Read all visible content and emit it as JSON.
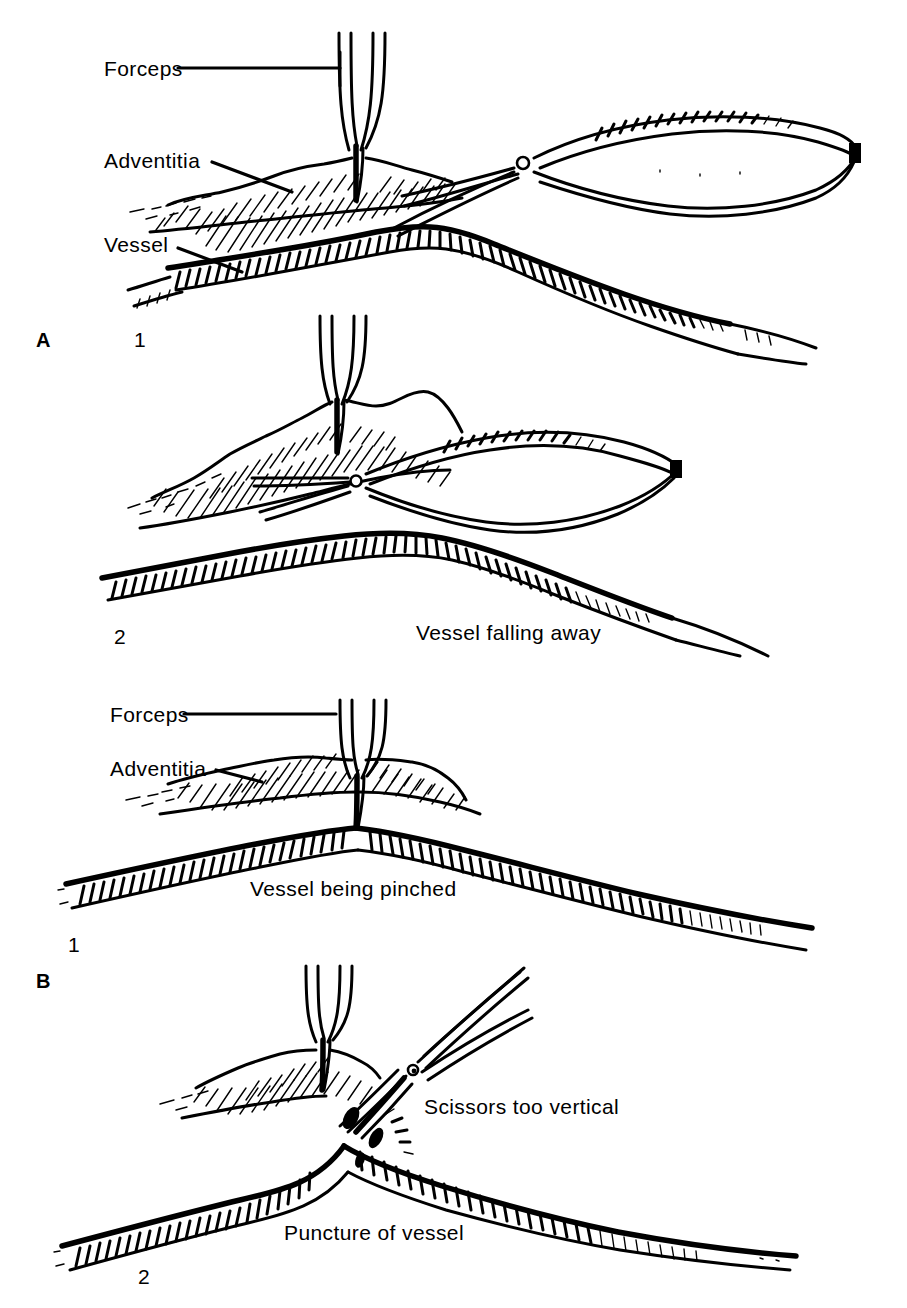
{
  "figure": {
    "kind": "surgical-technique-line-drawing",
    "background_color": "#ffffff",
    "ink_color": "#000000"
  },
  "panels": [
    {
      "id": "A1",
      "letter": "A",
      "number": "1",
      "labels": [
        {
          "name": "forceps",
          "text": "Forceps"
        },
        {
          "name": "adventitia",
          "text": "Adventitia"
        },
        {
          "name": "vessel",
          "text": "Vessel"
        }
      ],
      "captions": [],
      "instruments": [
        "forceps",
        "spring-scissors"
      ],
      "tissue": [
        "adventitia",
        "vessel-wall"
      ]
    },
    {
      "id": "A2",
      "letter": "",
      "number": "2",
      "labels": [],
      "captions": [
        {
          "name": "vessel-falling-away",
          "text": "Vessel falling away"
        }
      ],
      "instruments": [
        "forceps",
        "spring-scissors"
      ],
      "tissue": [
        "adventitia",
        "vessel-wall"
      ]
    },
    {
      "id": "B1",
      "letter": "",
      "number": "1",
      "labels": [
        {
          "name": "forceps",
          "text": "Forceps"
        },
        {
          "name": "adventitia",
          "text": "Adventitia"
        }
      ],
      "captions": [
        {
          "name": "vessel-being-pinched",
          "text": "Vessel being pinched"
        }
      ],
      "instruments": [
        "forceps"
      ],
      "tissue": [
        "adventitia",
        "vessel-wall"
      ]
    },
    {
      "id": "B2",
      "letter": "B",
      "number": "2",
      "labels": [],
      "captions": [
        {
          "name": "scissors-too-vertical",
          "text": "Scissors too vertical"
        },
        {
          "name": "puncture-of-vessel",
          "text": "Puncture of vessel"
        }
      ],
      "instruments": [
        "forceps",
        "spring-scissors"
      ],
      "tissue": [
        "adventitia",
        "vessel-wall",
        "puncture-site"
      ]
    }
  ],
  "text": {
    "a1_forceps": "Forceps",
    "a1_adventitia": "Adventitia",
    "a1_vessel": "Vessel",
    "a_letter": "A",
    "a1_number": "1",
    "a2_number": "2",
    "a2_caption": "Vessel falling away",
    "b1_forceps": "Forceps",
    "b1_adventitia": "Adventitia",
    "b1_caption": "Vessel being pinched",
    "b1_number": "1",
    "b_letter": "B",
    "b2_number": "2",
    "b2_caption_scissors": "Scissors too vertical",
    "b2_caption_puncture": "Puncture of vessel"
  }
}
